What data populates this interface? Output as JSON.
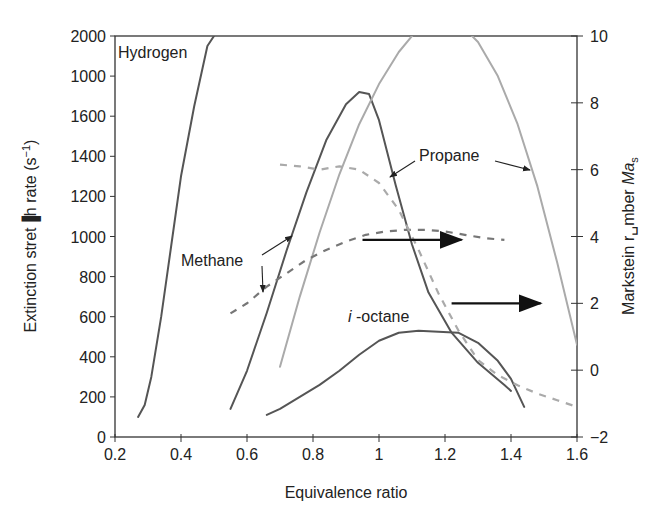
{
  "chart_data": {
    "type": "line",
    "title": "",
    "xlabel": "Equivalence ratio",
    "ylabel_left": "Extinction stretch rate (s^-1)",
    "ylabel_left_display": "Extinction stret▐h rate (s −1)",
    "ylabel_right": "Markstein number Ma_s",
    "xlim": [
      0.2,
      1.6
    ],
    "ylim_left": [
      0,
      2000
    ],
    "ylim_right": [
      -2,
      10
    ],
    "x_ticks": [
      "0.2",
      "0.4",
      "0.6",
      "0.8",
      "1",
      "1.2",
      "1.4",
      "1.6"
    ],
    "y_left_ticks": [
      "0",
      "200",
      "400",
      "600",
      "800",
      "1000",
      "1200",
      "1400",
      "1600",
      "1000",
      "2000"
    ],
    "y_right_ticks": [
      "−2",
      "0",
      "2",
      "4",
      "6",
      "8",
      "10"
    ],
    "grid": false,
    "series": [
      {
        "name": "Hydrogen extinction stretch rate",
        "axis": "left",
        "style": "solid",
        "color": "#555555",
        "x": [
          0.27,
          0.29,
          0.31,
          0.34,
          0.37,
          0.4,
          0.44,
          0.48,
          0.5
        ],
        "y": [
          100,
          160,
          300,
          600,
          950,
          1300,
          1650,
          1950,
          2000
        ]
      },
      {
        "name": "Methane extinction stretch rate",
        "axis": "left",
        "style": "solid",
        "color": "#555555",
        "x": [
          0.55,
          0.6,
          0.66,
          0.72,
          0.78,
          0.84,
          0.9,
          0.94,
          0.97,
          1.0,
          1.05,
          1.1,
          1.15,
          1.22,
          1.3,
          1.38,
          1.4
        ],
        "y": [
          140,
          330,
          620,
          930,
          1220,
          1480,
          1660,
          1720,
          1710,
          1580,
          1260,
          960,
          720,
          520,
          370,
          260,
          230
        ]
      },
      {
        "name": "Propane extinction stretch rate",
        "axis": "left",
        "style": "solid",
        "color": "#aaaaaa",
        "x": [
          0.7,
          0.76,
          0.82,
          0.88,
          0.94,
          1.0,
          1.06,
          1.12,
          1.18,
          1.24,
          1.3,
          1.36,
          1.42,
          1.48,
          1.54,
          1.6
        ],
        "y": [
          350,
          700,
          1020,
          1310,
          1560,
          1760,
          1920,
          2040,
          2090,
          2070,
          1970,
          1800,
          1560,
          1250,
          870,
          460
        ]
      },
      {
        "name": "i-octane extinction stretch rate",
        "axis": "left",
        "style": "solid",
        "color": "#555555",
        "x": [
          0.66,
          0.7,
          0.76,
          0.82,
          0.88,
          0.94,
          1.0,
          1.06,
          1.12,
          1.18,
          1.24,
          1.3,
          1.36,
          1.4,
          1.44
        ],
        "y": [
          110,
          140,
          200,
          260,
          330,
          410,
          480,
          520,
          530,
          525,
          520,
          470,
          380,
          290,
          150
        ]
      },
      {
        "name": "Methane Markstein number",
        "axis": "right",
        "style": "dashed",
        "color": "#777777",
        "x": [
          0.55,
          0.6,
          0.66,
          0.72,
          0.78,
          0.84,
          0.9,
          0.96,
          1.02,
          1.08,
          1.14,
          1.2,
          1.26,
          1.32,
          1.38
        ],
        "y": [
          1.7,
          2.0,
          2.5,
          2.9,
          3.3,
          3.6,
          3.85,
          4.05,
          4.15,
          4.2,
          4.2,
          4.15,
          4.05,
          3.95,
          3.9
        ]
      },
      {
        "name": "Propane Markstein number",
        "axis": "right",
        "style": "dashed",
        "color": "#aaaaaa",
        "x": [
          0.7,
          0.76,
          0.82,
          0.88,
          0.94,
          1.0,
          1.06,
          1.12,
          1.18,
          1.24,
          1.3,
          1.36,
          1.42,
          1.48,
          1.54,
          1.6
        ],
        "y": [
          6.15,
          6.1,
          6.0,
          6.1,
          6.0,
          5.6,
          4.8,
          3.6,
          2.3,
          1.2,
          0.3,
          -0.15,
          -0.45,
          -0.7,
          -0.9,
          -1.1
        ]
      }
    ],
    "annotations": [
      {
        "text": "Hydrogen",
        "x": 0.23,
        "y": 1920
      },
      {
        "text": "Methane",
        "x": 0.36,
        "y": 880,
        "arrows_to": [
          [
            0.73,
            1000
          ],
          [
            0.66,
            700
          ]
        ]
      },
      {
        "text": "Propane",
        "x": 1.08,
        "y": 1330,
        "arrows_to": [
          [
            1.04,
            1300
          ],
          [
            1.48,
            1320
          ]
        ]
      },
      {
        "text": "i-octane",
        "x": 0.97,
        "y": 580
      }
    ],
    "axis_arrows": [
      {
        "from": [
          0.95,
          3.9
        ],
        "to": [
          1.25,
          3.9
        ],
        "meaning": "methane Markstein curve uses right axis"
      },
      {
        "from": [
          1.22,
          2.0
        ],
        "to": [
          1.49,
          2.0
        ],
        "meaning": "propane Markstein curve uses right axis"
      }
    ]
  },
  "labels": {
    "hydrogen": "Hydrogen",
    "methane": "Methane",
    "propane": "Propane",
    "ioctane_i": "i",
    "ioctane_rest": " -octane",
    "xlabel": "Equivalence ratio",
    "ylabel_left_main": "Extinction stret▐h rate (s",
    "ylabel_left_sup": "−1",
    "ylabel_left_end": ")",
    "ylabel_right_main": "Markstein r␣mber ",
    "ylabel_right_ma": "Ma",
    "ylabel_right_sub": "s"
  }
}
